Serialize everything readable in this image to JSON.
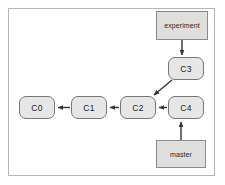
{
  "diagram": {
    "frame": {
      "border_color": "#b5b5b5",
      "background": "#ffffff"
    },
    "node_style": {
      "fill": "#e6e6e6",
      "stroke": "#777777"
    },
    "ref_style": {
      "fill": "#dededd",
      "stroke": "#8a8a8a"
    },
    "edge_color": "#333333",
    "commits": [
      {
        "id": "c0",
        "label": "C0"
      },
      {
        "id": "c1",
        "label": "C1"
      },
      {
        "id": "c2",
        "label": "C2"
      },
      {
        "id": "c3",
        "label": "C3"
      },
      {
        "id": "c4",
        "label": "C4"
      }
    ],
    "refs": [
      {
        "id": "experiment",
        "label": "experiment",
        "points_to": "C3"
      },
      {
        "id": "master",
        "label": "master",
        "points_to": "C4"
      }
    ],
    "edges": [
      {
        "from": "C1",
        "to": "C0",
        "kind": "parent"
      },
      {
        "from": "C2",
        "to": "C1",
        "kind": "parent"
      },
      {
        "from": "C4",
        "to": "C2",
        "kind": "parent"
      },
      {
        "from": "C3",
        "to": "C2",
        "kind": "parent"
      },
      {
        "from": "experiment",
        "to": "C3",
        "kind": "ref"
      },
      {
        "from": "master",
        "to": "C4",
        "kind": "ref"
      }
    ]
  }
}
